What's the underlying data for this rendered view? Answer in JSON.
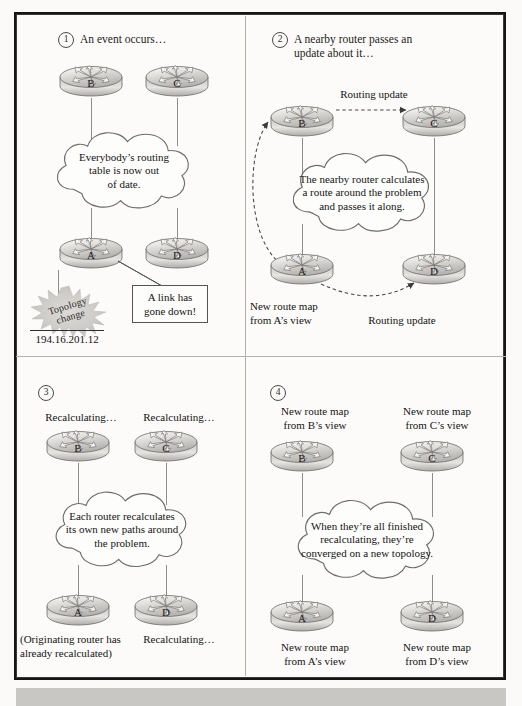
{
  "figure": {
    "ip_label": "194.16.201.12",
    "colors": {
      "frame": "#151515",
      "page_background": "#fbfaf8",
      "divider": "#b3b1ad",
      "router_body": "#d8d6d2",
      "link": "#8e8c88",
      "bottom_band": "#c9c7c3"
    }
  },
  "panels": [
    {
      "number": "1",
      "heading": "An event occurs…",
      "routers": [
        {
          "label": "B"
        },
        {
          "label": "C"
        },
        {
          "label": "A"
        },
        {
          "label": "D"
        }
      ],
      "cloud_text": "Everybody’s routing\ntable is now out\nof date.",
      "callout": "A link has\ngone down!",
      "burst_text": "Topology\nchange",
      "ip": "194.16.201.12"
    },
    {
      "number": "2",
      "heading": "A nearby router passes an\nupdate about it…",
      "routers": [
        {
          "label": "B"
        },
        {
          "label": "C"
        },
        {
          "label": "A"
        },
        {
          "label": "D"
        }
      ],
      "cloud_text": "The nearby router calculates\na route around the problem\nand passes it along.",
      "arrow_label_top": "Routing update",
      "arrow_label_bottom": "Routing update",
      "caption_bottom_left": "New route map\nfrom A’s view"
    },
    {
      "number": "3",
      "heading": "",
      "routers": [
        {
          "label": "B"
        },
        {
          "label": "C"
        },
        {
          "label": "A"
        },
        {
          "label": "D"
        }
      ],
      "cloud_text": "Each router recalculates\nits own new paths around\nthe problem.",
      "caption_top_left": "Recalculating…",
      "caption_top_right": "Recalculating…",
      "caption_bottom_left": "(Originating router has\nalready recalculated)",
      "caption_bottom_right": "Recalculating…"
    },
    {
      "number": "4",
      "heading": "",
      "routers": [
        {
          "label": "B"
        },
        {
          "label": "C"
        },
        {
          "label": "A"
        },
        {
          "label": "D"
        }
      ],
      "cloud_text": "When they’re all finished\nrecalculating, they’re\nconverged on a new topology.",
      "caption_top_left": "New route map\nfrom B’s view",
      "caption_top_right": "New route map\nfrom C’s view",
      "caption_bottom_left": "New route map\nfrom A’s view",
      "caption_bottom_right": "New route map\nfrom D’s view"
    }
  ]
}
